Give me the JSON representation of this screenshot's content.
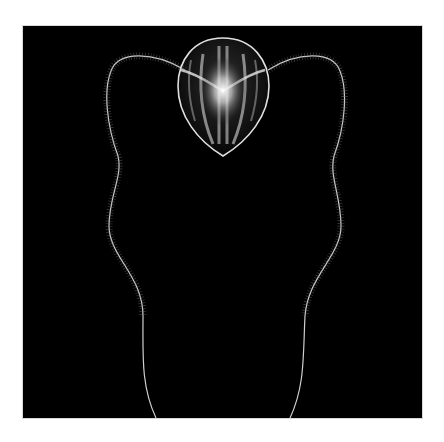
{
  "image": {
    "subject": "comb jelly (ctenophore) with two long fringed tentacles",
    "background_color": "#000000",
    "frame_color": "#ffffff",
    "subject_color": "#e8e8e8"
  }
}
